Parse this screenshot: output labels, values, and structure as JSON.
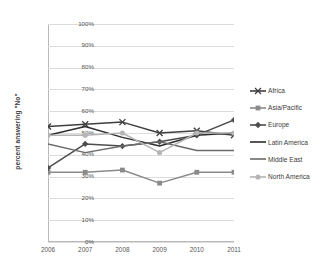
{
  "chart_data": {
    "type": "line",
    "title": "",
    "xlabel": "",
    "ylabel": "percent answering \"No\"",
    "x": [
      "2006",
      "2007",
      "2008",
      "2009",
      "2010",
      "2011"
    ],
    "ylim": [
      0,
      100
    ],
    "ytick_labels": [
      "100%",
      "90%",
      "80%",
      "70%",
      "60%",
      "50%",
      "40%",
      "30%",
      "20%",
      "10%",
      "0%"
    ],
    "ytick_values": [
      100,
      90,
      80,
      70,
      60,
      50,
      40,
      30,
      20,
      10,
      0
    ],
    "grid": "horizontal",
    "legend_position": "right",
    "series": [
      {
        "name": "Africa",
        "values": [
          53,
          54,
          55,
          50,
          51,
          49
        ],
        "color": "#3f3f3f",
        "marker": "x-marker"
      },
      {
        "name": "Asia/Pacific",
        "values": [
          32,
          32,
          33,
          27,
          32,
          32
        ],
        "color": "#8a8a8a",
        "marker": "square-marker"
      },
      {
        "name": "Europe",
        "values": [
          34,
          45,
          44,
          46,
          49,
          56
        ],
        "color": "#4d4d4d",
        "marker": "diamond-marker"
      },
      {
        "name": "Latin America",
        "values": [
          49,
          53,
          48,
          44,
          49,
          50
        ],
        "color": "#2e2e2e",
        "marker": "none"
      },
      {
        "name": "Middle East",
        "values": [
          45,
          41,
          44,
          46,
          42,
          42
        ],
        "color": "#6b6b6b",
        "marker": "none"
      },
      {
        "name": "North America",
        "values": [
          49,
          49,
          50,
          41,
          50,
          50
        ],
        "color": "#b5b5b5",
        "marker": "circle-marker"
      }
    ]
  }
}
